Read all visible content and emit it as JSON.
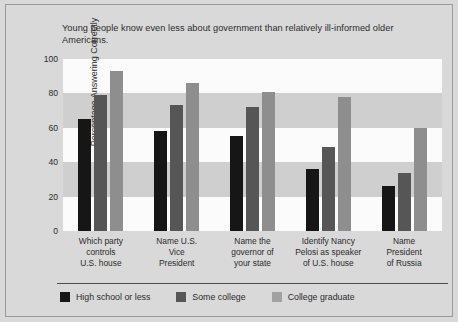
{
  "chart_data": {
    "type": "bar",
    "title": "Young people know even less about government than relatively ill-informed older Americans.",
    "xlabel": "",
    "ylabel": "Percentage Answering Correctly",
    "ylim": [
      0,
      100
    ],
    "yticks": [
      0,
      20,
      40,
      60,
      80,
      100
    ],
    "grid": "horizontal alternating shaded bands every 20 units",
    "legend_position": "bottom-left",
    "categories": [
      "Which party controls U.S. house",
      "Name U.S. Vice President",
      "Name the governor of your state",
      "Identify Nancy Pelosi as speaker of U.S. house",
      "Name President of Russia"
    ],
    "category_lines": [
      [
        "Which party",
        "controls",
        "U.S. house"
      ],
      [
        "Name U.S.",
        "Vice",
        "President"
      ],
      [
        "Name the",
        "governor of",
        "your state"
      ],
      [
        "Identify Nancy",
        "Pelosi as speaker",
        "of U.S. house"
      ],
      [
        "Name",
        "President",
        "of Russia"
      ]
    ],
    "series": [
      {
        "name": "High school or less",
        "color": "#161616",
        "values": [
          65,
          58,
          55,
          36,
          26
        ]
      },
      {
        "name": "Some college",
        "color": "#565656",
        "values": [
          79,
          73,
          72,
          49,
          34
        ]
      },
      {
        "name": "College graduate",
        "color": "#8e8e8e",
        "values": [
          93,
          86,
          81,
          78,
          60
        ]
      }
    ]
  },
  "colors": {
    "background": "#d9d9d9",
    "band_light": "#fbfbfb",
    "band_dark": "#cfcfcf",
    "text": "#2b2b2b",
    "rule": "#4d4d4d"
  }
}
